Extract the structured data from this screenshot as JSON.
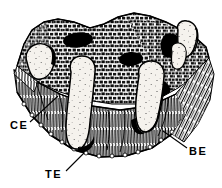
{
  "figure": {
    "background_color": "#ffffff",
    "ink_color": "#000000",
    "style": "black-and-white stippled line drawing"
  },
  "labels": [
    {
      "id": "ce",
      "text": "CE",
      "meaning": "cross-section epithelium",
      "x": 10,
      "y": 129,
      "leader": {
        "from_x": 30,
        "from_y": 122,
        "to_x": 58,
        "to_y": 96
      }
    },
    {
      "id": "te",
      "text": "TE",
      "meaning": "taste bud epithelium",
      "x": 45,
      "y": 178,
      "leader": {
        "from_x": 66,
        "from_y": 171,
        "to_x": 84,
        "to_y": 153
      }
    },
    {
      "id": "be",
      "text": "BE",
      "meaning": "basal epithelium",
      "x": 189,
      "y": 155,
      "leader": {
        "from_x": 187,
        "from_y": 148,
        "to_x": 163,
        "to_y": 131
      }
    }
  ],
  "structures": {
    "top_surface": {
      "name": "cobblestone epithelial surface",
      "texture": "polygonal cell mosaic"
    },
    "pores": {
      "name": "taste pores",
      "count": 4,
      "fill": "#000000"
    },
    "taste_buds": {
      "name": "taste buds",
      "count": 5,
      "fill": "#f4f1ec"
    },
    "lower_layer": {
      "name": "basal connective layer",
      "texture": "fine vertical hatching"
    }
  }
}
